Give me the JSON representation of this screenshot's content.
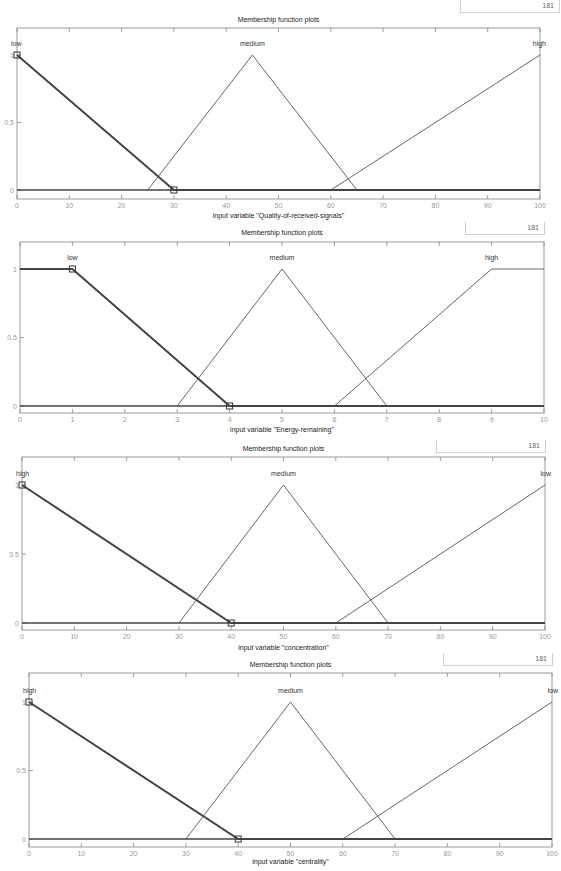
{
  "figure": {
    "panel_title": "Membership function plots",
    "points_value": "181"
  },
  "chart_data": [
    {
      "type": "line",
      "title": "Membership function plots",
      "xlabel": "input variable \"Quality-of-received-signals\"",
      "ylabel": "",
      "xlim": [
        0,
        100
      ],
      "ylim": [
        0,
        1
      ],
      "xticks": [
        0,
        10,
        20,
        30,
        40,
        50,
        60,
        70,
        80,
        90,
        100
      ],
      "xtick_labels": [
        "0",
        "10",
        "20",
        "30",
        "40",
        "50",
        "60",
        "70",
        "80",
        "90",
        "100"
      ],
      "yticks": [
        0,
        0.5,
        1
      ],
      "ytick_labels": [
        "0",
        "0.5",
        "1"
      ],
      "series": [
        {
          "name": "low",
          "selected": true,
          "x": [
            0,
            0,
            30,
            100
          ],
          "y": [
            1,
            1,
            0,
            0
          ],
          "label_x": 0,
          "label_anchor": "start"
        },
        {
          "name": "medium",
          "selected": false,
          "x": [
            25,
            45,
            65
          ],
          "y": [
            0,
            1,
            0
          ],
          "label_x": 45,
          "label_anchor": "middle"
        },
        {
          "name": "high",
          "selected": false,
          "x": [
            60,
            100
          ],
          "y": [
            0,
            1
          ],
          "label_x": 100,
          "label_anchor": "end"
        }
      ],
      "marker_points": [
        [
          0,
          1
        ],
        [
          30,
          0
        ]
      ]
    },
    {
      "type": "line",
      "title": "Membership function plots",
      "xlabel": "input variable \"Energy-remaining\"",
      "ylabel": "",
      "xlim": [
        0,
        10
      ],
      "ylim": [
        0,
        1
      ],
      "xticks": [
        0,
        1,
        2,
        3,
        4,
        5,
        6,
        7,
        8,
        9,
        10
      ],
      "xtick_labels": [
        "0",
        "1",
        "2",
        "3",
        "4",
        "5",
        "6",
        "7",
        "8",
        "9",
        "10"
      ],
      "yticks": [
        0,
        0.5,
        1
      ],
      "ytick_labels": [
        "0",
        "0.5",
        "1"
      ],
      "series": [
        {
          "name": "low",
          "selected": true,
          "x": [
            0,
            1,
            4,
            10
          ],
          "y": [
            1,
            1,
            0,
            0
          ],
          "label_x": 1,
          "label_anchor": "middle"
        },
        {
          "name": "medium",
          "selected": false,
          "x": [
            3,
            5,
            7
          ],
          "y": [
            0,
            1,
            0
          ],
          "label_x": 5,
          "label_anchor": "middle"
        },
        {
          "name": "high",
          "selected": false,
          "x": [
            6,
            9,
            10
          ],
          "y": [
            0,
            1,
            1
          ],
          "label_x": 9,
          "label_anchor": "middle"
        }
      ],
      "marker_points": [
        [
          1,
          1
        ],
        [
          4,
          0
        ]
      ]
    },
    {
      "type": "line",
      "title": "Membership function plots",
      "xlabel": "input variable \"concentration\"",
      "ylabel": "",
      "xlim": [
        0,
        100
      ],
      "ylim": [
        0,
        1
      ],
      "xticks": [
        0,
        10,
        20,
        30,
        40,
        50,
        60,
        70,
        80,
        90,
        100
      ],
      "xtick_labels": [
        "0",
        "10",
        "20",
        "30",
        "40",
        "50",
        "60",
        "70",
        "80",
        "90",
        "100"
      ],
      "yticks": [
        0,
        0.5,
        1
      ],
      "ytick_labels": [
        "0",
        "0.5",
        "1"
      ],
      "series": [
        {
          "name": "high",
          "selected": true,
          "x": [
            0,
            40,
            100
          ],
          "y": [
            1,
            0,
            0
          ],
          "label_x": 0,
          "label_anchor": "start"
        },
        {
          "name": "medium",
          "selected": false,
          "x": [
            30,
            50,
            70
          ],
          "y": [
            0,
            1,
            0
          ],
          "label_x": 50,
          "label_anchor": "middle"
        },
        {
          "name": "low",
          "selected": false,
          "x": [
            60,
            100
          ],
          "y": [
            0,
            1
          ],
          "label_x": 100,
          "label_anchor": "end"
        }
      ],
      "marker_points": [
        [
          0,
          1
        ],
        [
          40,
          0
        ]
      ]
    },
    {
      "type": "line",
      "title": "Membership function plots",
      "xlabel": "input variable \"centrality\"",
      "ylabel": "",
      "xlim": [
        0,
        100
      ],
      "ylim": [
        0,
        1
      ],
      "xticks": [
        0,
        10,
        20,
        30,
        40,
        50,
        60,
        70,
        80,
        90,
        100
      ],
      "xtick_labels": [
        "0",
        "10",
        "20",
        "30",
        "40",
        "50",
        "60",
        "70",
        "80",
        "90",
        "100"
      ],
      "yticks": [
        0,
        0.5,
        1
      ],
      "ytick_labels": [
        "0",
        "0.5",
        "1"
      ],
      "series": [
        {
          "name": "high",
          "selected": true,
          "x": [
            0,
            40,
            100
          ],
          "y": [
            1,
            0,
            0
          ],
          "label_x": 0,
          "label_anchor": "start"
        },
        {
          "name": "medium",
          "selected": false,
          "x": [
            30,
            50,
            70
          ],
          "y": [
            0,
            1,
            0
          ],
          "label_x": 50,
          "label_anchor": "middle"
        },
        {
          "name": "low",
          "selected": false,
          "x": [
            60,
            100
          ],
          "y": [
            0,
            1
          ],
          "label_x": 100,
          "label_anchor": "end"
        }
      ],
      "marker_points": [
        [
          0,
          1
        ],
        [
          40,
          0
        ]
      ]
    }
  ]
}
